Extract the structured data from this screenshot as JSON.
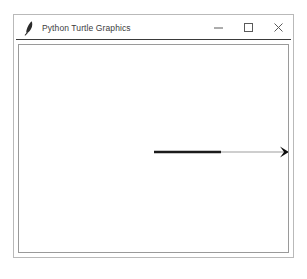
{
  "window": {
    "title": "Python Turtle Graphics",
    "icon": "feather-pen-icon",
    "frame_color": "#b9b9b9",
    "title_bar_color": "#ffffff",
    "title_text_color": "#3d3d3d",
    "separator_color": "#3a3a3a",
    "controls": [
      {
        "name": "minimize",
        "glyph": "—",
        "label": "Minimize"
      },
      {
        "name": "maximize",
        "glyph": "□",
        "label": "Maximize"
      },
      {
        "name": "close",
        "glyph": "×",
        "label": "Close"
      }
    ]
  },
  "canvas": {
    "background": "#ffffff",
    "border_color": "#9a9a9a",
    "width": 271,
    "height": 209,
    "drawing": {
      "description": "horizontal line drawn left to right with turtle arrow cursor at end",
      "segments": [
        {
          "name": "drawn-stroke",
          "color": "#1b1b1b",
          "thickness": 2.4,
          "x1": 135,
          "y1": 107,
          "x2": 202,
          "y2": 107
        },
        {
          "name": "trailing-stroke",
          "color": "#9e9e9e",
          "thickness": 1.1,
          "x1": 202,
          "y1": 107,
          "x2": 270,
          "y2": 107
        }
      ],
      "turtle": {
        "name": "turtle-arrow-cursor",
        "shape": "arrow",
        "color": "#0d0d0d",
        "heading_degrees": 0,
        "x": 270,
        "y": 107
      }
    }
  }
}
